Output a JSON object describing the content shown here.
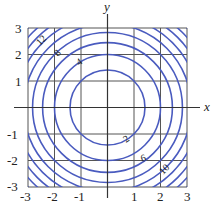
{
  "chart_data": {
    "type": "contour",
    "function": "x^2 + y^2",
    "title": "",
    "xlabel": "x",
    "ylabel": "y",
    "xlim": [
      -3,
      3
    ],
    "ylim": [
      -3,
      3
    ],
    "grid": true,
    "xticks": [
      "-3",
      "-2",
      "-1",
      "1",
      "2",
      "3"
    ],
    "yticks": [
      "3",
      "2",
      "1",
      "-1",
      "-2",
      "-3"
    ],
    "levels": [
      2,
      4,
      6,
      8,
      10,
      12,
      14,
      16,
      18
    ],
    "labeled_levels": [
      {
        "value": "12",
        "quadrant": "upper-left"
      },
      {
        "value": "8",
        "quadrant": "upper-left"
      },
      {
        "value": "4",
        "quadrant": "upper-left"
      },
      {
        "value": "2",
        "quadrant": "lower-right"
      },
      {
        "value": "6",
        "quadrant": "lower-right"
      },
      {
        "value": "10",
        "quadrant": "lower-right"
      }
    ],
    "colors": {
      "contour": "#4a5bbf",
      "grid": "#555555",
      "axis": "#333333"
    }
  }
}
